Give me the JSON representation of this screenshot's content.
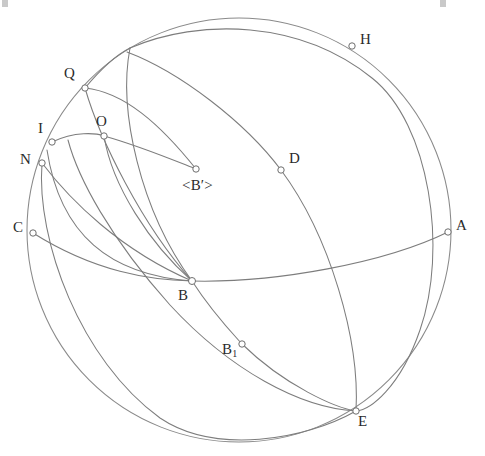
{
  "figure": {
    "kind": "spherical-geometry-diagram",
    "width": 485,
    "height": 456,
    "background_color": "#ffffff",
    "line_color": "#7d7d7d",
    "label_color": "#2b2b2b",
    "marker_fill": "#ffffff",
    "marker_stroke": "#6e6e6e"
  },
  "sphere": {
    "center_x": 239,
    "center_y": 230,
    "radius": 212
  },
  "points": [
    {
      "id": "H",
      "label": "H",
      "x": 352,
      "y": 46,
      "label_x": 360,
      "label_y": 32
    },
    {
      "id": "Q",
      "label": "Q",
      "x": 85,
      "y": 88,
      "label_x": 64,
      "label_y": 66
    },
    {
      "id": "O",
      "label": "O",
      "x": 104,
      "y": 136,
      "label_x": 96,
      "label_y": 114
    },
    {
      "id": "I",
      "label": "I",
      "x": 52,
      "y": 142,
      "label_x": 38,
      "label_y": 121
    },
    {
      "id": "N",
      "label": "N",
      "x": 42,
      "y": 163,
      "label_x": 20,
      "label_y": 152
    },
    {
      "id": "D",
      "label": "D",
      "x": 281,
      "y": 170,
      "label_x": 289,
      "label_y": 151
    },
    {
      "id": "Bp",
      "label": "<B′>",
      "x": 196,
      "y": 169,
      "label_x": 182,
      "label_y": 178
    },
    {
      "id": "C",
      "label": "C",
      "x": 33,
      "y": 233,
      "label_x": 13,
      "label_y": 220
    },
    {
      "id": "A",
      "label": "A",
      "x": 448,
      "y": 232,
      "label_x": 456,
      "label_y": 218
    },
    {
      "id": "B",
      "label": "B",
      "x": 192,
      "y": 281,
      "label_x": 178,
      "label_y": 288
    },
    {
      "id": "B1",
      "label": "B",
      "sub": "1",
      "x": 242,
      "y": 344,
      "label_x": 222,
      "label_y": 342
    },
    {
      "id": "E",
      "label": "E",
      "x": 356,
      "y": 411,
      "label_x": 358,
      "label_y": 414
    }
  ],
  "arcs": [
    {
      "id": "sphere-outline",
      "name": "sphere-silhouette"
    },
    {
      "id": "equator-CA",
      "name": "equator-arc-C-to-A"
    },
    {
      "id": "great-circle-HE",
      "name": "great-circle-H-to-E"
    },
    {
      "id": "great-circle-NE",
      "name": "great-circle-N-to-E"
    },
    {
      "id": "meridian-QB",
      "name": "meridian-Q-to-B"
    },
    {
      "id": "meridian-IB",
      "name": "meridian-I-to-B"
    },
    {
      "id": "meridian-NB",
      "name": "meridian-N-to-B"
    },
    {
      "id": "arc-topjunction-B",
      "name": "arc-top-junction-to-B"
    },
    {
      "id": "arc-I-to-Bprime",
      "name": "arc-I-to-B-prime"
    },
    {
      "id": "arc-Q-to-O",
      "name": "arc-Q-to-O-small"
    },
    {
      "id": "arc-B1-line",
      "name": "arc-through-B1"
    }
  ],
  "corner_artifacts": [
    {
      "x": 2,
      "y": 0
    },
    {
      "x": 440,
      "y": 0
    }
  ]
}
